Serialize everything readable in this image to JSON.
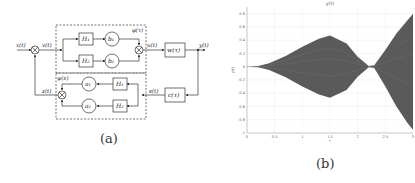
{
  "panel_a": {
    "caption": "(a)",
    "signals": {
      "x": "x(t)",
      "v": "v(t)",
      "phi": "φ(τ)",
      "u": "u(t)",
      "y": "y(t)",
      "z": "z(t)",
      "psi": "ψ(ε)",
      "s": "s(t)"
    },
    "blocks": {
      "H1_top": "H₁",
      "H2_top": "H₂",
      "b1": "b₁",
      "b2": "b₂",
      "w": "w(τ)",
      "H1_bot": "H₁",
      "H2_bot": "H₂",
      "a1": "a₁",
      "a2": "a₂",
      "c": "c(τ)"
    }
  },
  "panel_b": {
    "caption": "(b)"
  },
  "chart_data": {
    "type": "area",
    "title": "y(t)",
    "xlabel": "t",
    "ylabel": "y(t)",
    "xlim": [
      0,
      3
    ],
    "ylim": [
      -1,
      0.9
    ],
    "xticks": [
      "0",
      "0.5",
      "1",
      "1.5",
      "2",
      "2.5",
      "3"
    ],
    "yticks": [
      "0.8",
      "0.6",
      "0.4",
      "0.2",
      "0",
      "-0.2",
      "-0.4",
      "-0.6",
      "-0.8",
      "-1"
    ],
    "grid": true,
    "envelope": {
      "t": [
        0,
        0.2,
        0.4,
        0.7,
        1.0,
        1.3,
        1.5,
        1.8,
        2.0,
        2.2,
        2.3,
        2.5,
        2.7,
        2.9,
        3.0
      ],
      "upper": [
        0,
        0.01,
        0.05,
        0.16,
        0.3,
        0.42,
        0.47,
        0.35,
        0.15,
        0.01,
        0.02,
        0.25,
        0.5,
        0.7,
        0.8
      ],
      "lower": [
        0,
        -0.01,
        -0.05,
        -0.16,
        -0.3,
        -0.42,
        -0.47,
        -0.35,
        -0.15,
        -0.01,
        -0.02,
        -0.3,
        -0.6,
        -0.85,
        -0.95
      ]
    },
    "series_color": "#5a5a5a"
  }
}
